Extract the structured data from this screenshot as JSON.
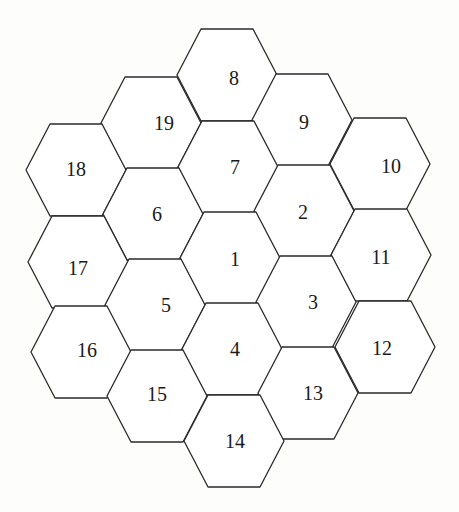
{
  "diagram": {
    "colors": {
      "background": "#fdfdfc",
      "cell_fill": "#ffffff",
      "stroke": "#2a2a2a",
      "label": "#1a1a1a"
    },
    "hex_geometry": {
      "half_width": 50,
      "half_top_edge": 26,
      "half_height": 46
    },
    "cells": [
      {
        "id": "8",
        "label": "8",
        "cx": 227,
        "cy": 75,
        "lx": 234,
        "ly": 78
      },
      {
        "id": "19",
        "label": "19",
        "cx": 151,
        "cy": 123,
        "lx": 164,
        "ly": 123
      },
      {
        "id": "9",
        "label": "9",
        "cx": 302,
        "cy": 120,
        "lx": 304,
        "ly": 122
      },
      {
        "id": "18",
        "label": "18",
        "cx": 76,
        "cy": 170,
        "lx": 76,
        "ly": 169
      },
      {
        "id": "7",
        "label": "7",
        "cx": 228,
        "cy": 167,
        "lx": 235,
        "ly": 167
      },
      {
        "id": "10",
        "label": "10",
        "cx": 380,
        "cy": 164,
        "lx": 391,
        "ly": 166
      },
      {
        "id": "6",
        "label": "6",
        "cx": 153,
        "cy": 214,
        "lx": 157,
        "ly": 214
      },
      {
        "id": "2",
        "label": "2",
        "cx": 304,
        "cy": 211,
        "lx": 303,
        "ly": 212
      },
      {
        "id": "17",
        "label": "17",
        "cx": 78,
        "cy": 262,
        "lx": 78,
        "ly": 268
      },
      {
        "id": "1",
        "label": "1",
        "cx": 230,
        "cy": 258,
        "lx": 235,
        "ly": 259
      },
      {
        "id": "11",
        "label": "11",
        "cx": 381,
        "cy": 255,
        "lx": 381,
        "ly": 257
      },
      {
        "id": "5",
        "label": "5",
        "cx": 155,
        "cy": 305,
        "lx": 166,
        "ly": 305
      },
      {
        "id": "3",
        "label": "3",
        "cx": 306,
        "cy": 302,
        "lx": 313,
        "ly": 302
      },
      {
        "id": "16",
        "label": "16",
        "cx": 81,
        "cy": 352,
        "lx": 87,
        "ly": 350
      },
      {
        "id": "4",
        "label": "4",
        "cx": 232,
        "cy": 349,
        "lx": 235,
        "ly": 349
      },
      {
        "id": "12",
        "label": "12",
        "cx": 385,
        "cy": 347,
        "lx": 382,
        "ly": 348
      },
      {
        "id": "15",
        "label": "15",
        "cx": 157,
        "cy": 396,
        "lx": 157,
        "ly": 394
      },
      {
        "id": "13",
        "label": "13",
        "cx": 308,
        "cy": 393,
        "lx": 313,
        "ly": 393
      },
      {
        "id": "14",
        "label": "14",
        "cx": 234,
        "cy": 441,
        "lx": 235,
        "ly": 441
      }
    ]
  }
}
